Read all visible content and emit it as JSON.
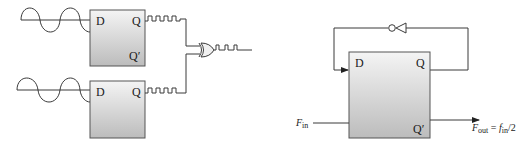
{
  "left_diagram": {
    "title": "Dual D flip-flop with XOR output",
    "flip_flops": [
      {
        "id": "ff-top",
        "pins": {
          "d": "D",
          "q": "Q",
          "q_bar": "Q′"
        }
      },
      {
        "id": "ff-bottom",
        "pins": {
          "d": "D",
          "q": "Q"
        }
      }
    ],
    "gate": "xor-gate",
    "inputs": [
      "sine-wave",
      "sine-wave"
    ],
    "outputs": [
      "square-wave",
      "square-wave",
      "pulse-train"
    ]
  },
  "right_diagram": {
    "title": "D flip-flop frequency divider",
    "flip_flop": {
      "pins": {
        "d": "D",
        "q": "Q",
        "q_bar": "Q′"
      }
    },
    "feedback": "inverter",
    "input_label": {
      "main": "F",
      "sub": "in"
    },
    "output_label": {
      "f_main": "F",
      "f_sub": "out",
      "equals": " = ",
      "rhs_main": "f",
      "rhs_sub": "in",
      "rhs_tail": "/2"
    }
  },
  "colors": {
    "box_top": "#f4f4f4",
    "box_bottom": "#bcbcbc",
    "wire": "#3a3a3a",
    "text": "#1a1a1a"
  }
}
